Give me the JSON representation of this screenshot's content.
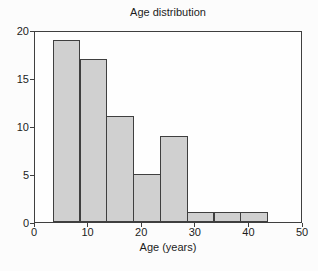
{
  "figure": {
    "width_px": 318,
    "height_px": 271,
    "background": "#fcfcfc"
  },
  "chart_data": {
    "type": "bar",
    "subtype": "histogram",
    "title": "Age distribution",
    "xlabel": "Age (years)",
    "ylabel": "",
    "xlim": [
      0,
      50
    ],
    "ylim": [
      0,
      20
    ],
    "xticks": [
      0,
      10,
      20,
      30,
      40,
      50
    ],
    "yticks": [
      0,
      5,
      10,
      15,
      20
    ],
    "bin_edges": [
      3.3,
      8.3,
      13.3,
      18.3,
      23.3,
      28.3,
      33.3,
      38.3,
      43.3
    ],
    "counts": [
      19,
      17,
      11,
      5,
      9,
      1,
      1,
      1
    ],
    "grid": false,
    "legend": "none",
    "bar_fill": "#d0d0d0",
    "bar_edge": "#3f3f3f",
    "axis_color": "#3f3f3f",
    "text_color": "#1c1c1c"
  }
}
